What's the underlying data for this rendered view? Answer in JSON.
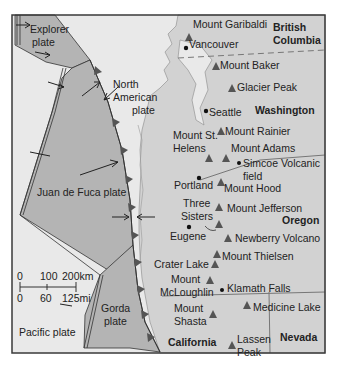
{
  "colors": {
    "ocean": "#e9e9e9",
    "land": "#d2d2d2",
    "plate_fill": "#b4b4b4",
    "frame": "#3a3a3a",
    "volcano": "#555555"
  },
  "plates": {
    "explorer": [
      "Explorer",
      "plate"
    ],
    "north_american": [
      "North",
      "American",
      "plate"
    ],
    "juan_de_fuca": "Juan de Fuca plate",
    "gorda": [
      "Gorda",
      "plate"
    ],
    "pacific": "Pacific plate"
  },
  "regions": {
    "british_columbia": [
      "British",
      "Columbia"
    ],
    "washington": "Washington",
    "oregon": "Oregon",
    "california": "California",
    "nevada": "Nevada"
  },
  "volcanoes": [
    {
      "name": "Mount Garibaldi"
    },
    {
      "name": "Mount Baker"
    },
    {
      "name": "Glacier Peak"
    },
    {
      "name": "Mount Rainier"
    },
    {
      "name": "Mount St. Helens"
    },
    {
      "name": "Mount Adams"
    },
    {
      "name": "Mount Hood"
    },
    {
      "name": "Mount Jefferson"
    },
    {
      "name": "Three Sisters"
    },
    {
      "name": "Newberry Volcano"
    },
    {
      "name": "Mount Thielsen"
    },
    {
      "name": "Crater Lake"
    },
    {
      "name": "Mount McLoughlin"
    },
    {
      "name": "Medicine Lake"
    },
    {
      "name": "Mount Shasta"
    },
    {
      "name": "Lassen Peak"
    }
  ],
  "labels": {
    "garibaldi": "Mount Garibaldi",
    "baker": "Mount Baker",
    "glacier": "Glacier Peak",
    "rainier": "Mount Rainier",
    "st_helens": [
      "Mount St.",
      "Helens"
    ],
    "adams": "Mount Adams",
    "hood": "Mount Hood",
    "jefferson": "Mount Jefferson",
    "three_sisters": [
      "Three",
      "Sisters"
    ],
    "newberry": "Newberry Volcano",
    "thielsen": "Mount Thielsen",
    "crater_lake": "Crater Lake",
    "mcloughlin": [
      "Mount",
      "McLoughlin"
    ],
    "medicine_lake": "Medicine Lake",
    "shasta": [
      "Mount",
      "Shasta"
    ],
    "lassen": [
      "Lassen",
      "Peak"
    ],
    "simcoe": [
      "Simcoe Volcanic",
      "field"
    ]
  },
  "cities": {
    "vancouver": "Vancouver",
    "seattle": "Seattle",
    "portland": "Portland",
    "eugene": "Eugene",
    "klamath_falls": "Klamath Falls"
  },
  "scale_bar": {
    "km_ticks": [
      "0",
      "100",
      "200km"
    ],
    "mi_ticks": [
      "0",
      "60",
      "125mi"
    ]
  }
}
